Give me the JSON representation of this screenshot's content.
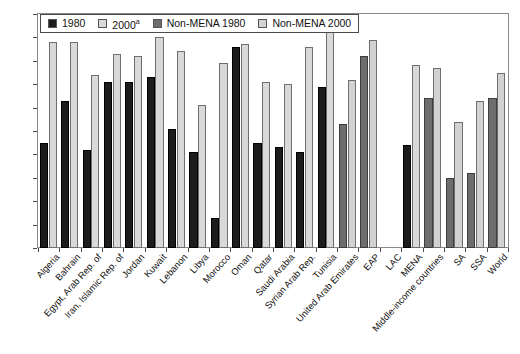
{
  "chart_data": {
    "type": "bar",
    "title": "",
    "xlabel": "",
    "ylabel": "",
    "ylim": [
      20,
      120
    ],
    "ytick_step": 10,
    "yticks": [
      120,
      110,
      100,
      90,
      80,
      70,
      60,
      50,
      40,
      30,
      20
    ],
    "grid": false,
    "legend_position": "top-left",
    "legend": [
      {
        "label": "1980",
        "series": "mena_1980",
        "color": "#1c1c1c"
      },
      {
        "label": "2000",
        "superscript": "a",
        "series": "mena_2000",
        "color": "#d9d9d9"
      },
      {
        "label": "Non-MENA 1980",
        "series": "nonmena_1980",
        "color": "#6d6d6d"
      },
      {
        "label": "Non-MENA 2000",
        "series": "nonmena_2000",
        "color": "#d2d2d2"
      }
    ],
    "categories": [
      "Algeria",
      "Bahrain",
      "Egypt, Arab Rep. of",
      "Iran, Islamic Rep. of",
      "Jordan",
      "Kuwait",
      "Lebanon",
      "Libya",
      "Morocco",
      "Oman",
      "Qatar",
      "Saudi Arabia",
      "Syrian Arab Rep.",
      "Tunisia",
      "United Arab Emirates",
      "EAP",
      "LAC",
      "MENA",
      "Middle-income countries",
      "SA",
      "SSA",
      "World"
    ],
    "series": [
      {
        "name": "1980",
        "group": "MENA",
        "color": "#1c1c1c",
        "values": [
          65,
          83,
          62,
          91,
          91,
          93,
          71,
          61,
          33,
          106,
          65,
          63,
          61,
          89,
          null,
          null,
          null,
          64,
          null,
          null,
          null,
          null
        ]
      },
      {
        "name": "2000",
        "group": "MENA",
        "color": "#d9d9d9",
        "values": [
          108,
          108,
          94,
          103,
          102,
          110,
          104,
          81,
          99,
          107,
          91,
          90,
          106,
          113,
          null,
          null,
          null,
          98,
          null,
          null,
          null,
          null
        ]
      },
      {
        "name": "Non-MENA 1980",
        "group": "Non-MENA",
        "color": "#6d6d6d",
        "values": [
          null,
          null,
          null,
          null,
          null,
          null,
          null,
          null,
          null,
          null,
          null,
          null,
          null,
          null,
          73,
          102,
          null,
          null,
          84,
          50,
          52,
          84
        ]
      },
      {
        "name": "Non-MENA 2000",
        "group": "Non-MENA",
        "color": "#d2d2d2",
        "values": [
          null,
          null,
          null,
          null,
          null,
          null,
          null,
          null,
          null,
          null,
          null,
          null,
          null,
          null,
          92,
          109,
          null,
          null,
          97,
          74,
          83,
          95
        ]
      }
    ],
    "bars": [
      {
        "category": "Algeria",
        "pairs": [
          {
            "series": "1980",
            "value": 65
          },
          {
            "series": "2000",
            "value": 108
          }
        ]
      },
      {
        "category": "Bahrain",
        "pairs": [
          {
            "series": "1980",
            "value": 83
          },
          {
            "series": "2000",
            "value": 108
          }
        ]
      },
      {
        "category": "Egypt, Arab Rep. of",
        "pairs": [
          {
            "series": "1980",
            "value": 62
          },
          {
            "series": "2000",
            "value": 94
          }
        ]
      },
      {
        "category": "Iran, Islamic Rep. of",
        "pairs": [
          {
            "series": "1980",
            "value": 91
          },
          {
            "series": "2000",
            "value": 103
          }
        ]
      },
      {
        "category": "Jordan",
        "pairs": [
          {
            "series": "1980",
            "value": 91
          },
          {
            "series": "2000",
            "value": 102
          }
        ]
      },
      {
        "category": "Kuwait",
        "pairs": [
          {
            "series": "1980",
            "value": 93
          },
          {
            "series": "2000",
            "value": 110
          }
        ]
      },
      {
        "category": "Lebanon",
        "pairs": [
          {
            "series": "1980",
            "value": 71
          },
          {
            "series": "2000",
            "value": 104
          }
        ]
      },
      {
        "category": "Libya",
        "pairs": [
          {
            "series": "1980",
            "value": 61
          },
          {
            "series": "2000",
            "value": 81
          }
        ]
      },
      {
        "category": "Morocco",
        "pairs": [
          {
            "series": "1980",
            "value": 33
          },
          {
            "series": "2000",
            "value": 99
          }
        ]
      },
      {
        "category": "Oman",
        "pairs": [
          {
            "series": "1980",
            "value": 106
          },
          {
            "series": "2000",
            "value": 107
          }
        ]
      },
      {
        "category": "Qatar",
        "pairs": [
          {
            "series": "1980",
            "value": 65
          },
          {
            "series": "2000",
            "value": 91
          }
        ]
      },
      {
        "category": "Saudi Arabia",
        "pairs": [
          {
            "series": "1980",
            "value": 63
          },
          {
            "series": "2000",
            "value": 90
          }
        ]
      },
      {
        "category": "Syrian Arab Rep.",
        "pairs": [
          {
            "series": "1980",
            "value": 61
          },
          {
            "series": "2000",
            "value": 106
          }
        ]
      },
      {
        "category": "Tunisia",
        "pairs": [
          {
            "series": "1980",
            "value": 89
          },
          {
            "series": "2000",
            "value": 113
          }
        ]
      },
      {
        "category": "United Arab Emirates",
        "pairs": [
          {
            "series": "Non-MENA 1980",
            "value": 73
          },
          {
            "series": "Non-MENA 2000",
            "value": 92
          }
        ]
      },
      {
        "category": "EAP",
        "pairs": [
          {
            "series": "Non-MENA 1980",
            "value": 102
          },
          {
            "series": "Non-MENA 2000",
            "value": 109
          }
        ]
      },
      {
        "category": "LAC",
        "pairs": [
          {
            "series": "1980",
            "value": 64
          },
          {
            "series": "Non-MENA 2000",
            "value": 98
          }
        ]
      },
      {
        "category": "MENA",
        "pairs": [
          {
            "series": "Non-MENA 1980",
            "value": 84
          },
          {
            "series": "Non-MENA 2000",
            "value": 97
          }
        ]
      },
      {
        "category": "Middle-income countries",
        "pairs": [
          {
            "series": "Non-MENA 1980",
            "value": 50
          },
          {
            "series": "Non-MENA 2000",
            "value": 74
          }
        ]
      },
      {
        "category": "SA",
        "pairs": [
          {
            "series": "Non-MENA 1980",
            "value": 52
          },
          {
            "series": "Non-MENA 2000",
            "value": 83
          }
        ]
      },
      {
        "category": "SSA",
        "pairs": [
          {
            "series": "Non-MENA 1980",
            "value": 84
          },
          {
            "series": "Non-MENA 2000",
            "value": 95
          }
        ]
      }
    ]
  },
  "axis": {
    "y_labels": [
      "120",
      "110",
      "100",
      "90",
      "80",
      "70",
      "60",
      "50",
      "40",
      "30",
      "20"
    ]
  },
  "x_axis_labels": [
    "Algeria",
    "Bahrain",
    "Egypt, Arab Rep. of",
    "Iran, Islamic Rep. of",
    "Jordan",
    "Kuwait",
    "Lebanon",
    "Libya",
    "Morocco",
    "Oman",
    "Qatar",
    "Saudi Arabia",
    "Syrian Arab Rep.",
    "Tunisia",
    "United Arab Emirates",
    "EAP",
    "LAC",
    "MENA",
    "Middle-income countries",
    "SA",
    "SSA",
    "World"
  ],
  "legend": {
    "items": [
      {
        "label": "1980",
        "sup": ""
      },
      {
        "label": "2000",
        "sup": "a"
      },
      {
        "label": "Non-MENA 1980",
        "sup": ""
      },
      {
        "label": "Non-MENA 2000",
        "sup": ""
      }
    ]
  },
  "colors": {
    "series_1980": "#1c1c1c",
    "series_2000": "#d9d9d9",
    "series_nonmena_1980": "#6d6d6d",
    "series_nonmena_2000": "#d2d2d2",
    "axis": "#4a4a4a",
    "background": "#ffffff"
  }
}
